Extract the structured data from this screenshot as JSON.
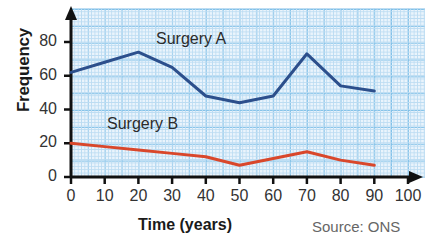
{
  "chart_data": {
    "type": "line",
    "title": "",
    "xlabel": "Time (years)",
    "ylabel": "Frequency",
    "x": [
      0,
      10,
      20,
      30,
      40,
      50,
      60,
      70,
      80,
      90
    ],
    "xlim": [
      0,
      100
    ],
    "ylim": [
      0,
      88
    ],
    "xticks": [
      "0",
      "10",
      "20",
      "30",
      "40",
      "50",
      "60",
      "70",
      "80",
      "90",
      "100"
    ],
    "yticks": [
      "0",
      "20",
      "40",
      "60",
      "80"
    ],
    "grid": true,
    "grid_style": "graph-paper",
    "legend_position": "inline-annotation",
    "series": [
      {
        "name": "Surgery A",
        "color": "#2c4f8c",
        "values": [
          62,
          68,
          74,
          65,
          48,
          44,
          48,
          73,
          54,
          51
        ]
      },
      {
        "name": "Surgery B",
        "color": "#d9472b",
        "values": [
          20,
          18,
          16,
          14,
          12,
          7,
          11,
          15,
          10,
          7
        ]
      }
    ],
    "annotations": [
      {
        "text": "Surgery A",
        "series": "Surgery A"
      },
      {
        "text": "Surgery B",
        "series": "Surgery B"
      }
    ],
    "source": "Source: ONS"
  },
  "axes": {
    "y_title": "Frequency",
    "x_title": "Time (years)",
    "y_tick_labels": [
      "80",
      "60",
      "40",
      "20",
      "0"
    ],
    "x_tick_labels": [
      "0",
      "10",
      "20",
      "30",
      "40",
      "50",
      "60",
      "70",
      "80",
      "90",
      "100"
    ]
  },
  "labels": {
    "series_a": "Surgery A",
    "series_b": "Surgery B",
    "source": "Source: ONS"
  },
  "colors": {
    "series_a": "#2c4f8c",
    "series_b": "#d9472b",
    "axis": "#111111",
    "grid_minor": "#bcdcf2",
    "grid_major": "#7fc0e8",
    "paper": "#eaf4fc"
  }
}
